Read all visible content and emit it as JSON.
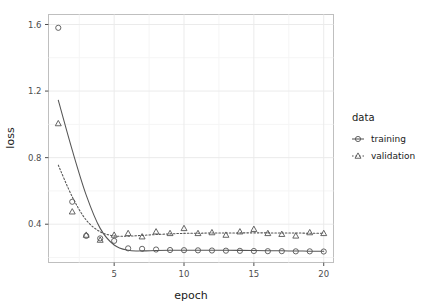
{
  "chart_data": {
    "type": "scatter",
    "title": "",
    "xlabel": "epoch",
    "ylabel": "loss",
    "xlim": [
      0.3,
      20.7
    ],
    "ylim": [
      0.17,
      1.66
    ],
    "xticks": [
      5,
      10,
      15,
      20
    ],
    "xtick_labels": [
      "5",
      "10",
      "15",
      "20"
    ],
    "yticks": [
      0.4,
      0.8,
      1.2,
      1.6
    ],
    "ytick_labels": [
      "0.4",
      "0.8",
      "1.2",
      "1.6"
    ],
    "grid": true,
    "grid_minor": true,
    "legend_position": "right",
    "legend": {
      "title": "data",
      "entries": [
        {
          "name": "training",
          "marker": "circle",
          "line": "solid"
        },
        {
          "name": "validation",
          "marker": "triangle",
          "line": "dotted"
        }
      ]
    },
    "x": [
      1,
      2,
      3,
      4,
      5,
      6,
      7,
      8,
      9,
      10,
      11,
      12,
      13,
      14,
      15,
      16,
      17,
      18,
      19,
      20
    ],
    "series": [
      {
        "name": "training",
        "marker": "circle",
        "line": "solid",
        "color": "#555555",
        "values": [
          1.58,
          0.535,
          0.33,
          0.315,
          0.3,
          0.255,
          0.252,
          0.248,
          0.245,
          0.244,
          0.243,
          0.242,
          0.241,
          0.24,
          0.239,
          0.238,
          0.238,
          0.237,
          0.237,
          0.236
        ],
        "smooth": [
          1.145,
          0.845,
          0.575,
          0.375,
          0.275,
          0.243,
          0.24,
          0.242,
          0.243,
          0.244,
          0.244,
          0.244,
          0.243,
          0.243,
          0.242,
          0.241,
          0.24,
          0.239,
          0.238,
          0.237
        ]
      },
      {
        "name": "validation",
        "marker": "triangle",
        "line": "dotted",
        "color": "#555555",
        "values": [
          1.005,
          0.475,
          0.335,
          0.305,
          0.335,
          0.345,
          0.325,
          0.355,
          0.345,
          0.375,
          0.345,
          0.35,
          0.335,
          0.355,
          0.37,
          0.345,
          0.34,
          0.33,
          0.35,
          0.345
        ],
        "smooth": [
          0.755,
          0.565,
          0.425,
          0.355,
          0.33,
          0.328,
          0.333,
          0.338,
          0.342,
          0.345,
          0.346,
          0.347,
          0.347,
          0.348,
          0.348,
          0.348,
          0.347,
          0.347,
          0.346,
          0.345
        ]
      }
    ]
  },
  "colors": {
    "panel_border": "#bfbfbf",
    "grid_major": "#ebebeb",
    "grid_minor": "#f5f5f5",
    "series": "#555555",
    "text": "#1a1a1a",
    "tick_text": "#4d4d4d"
  }
}
